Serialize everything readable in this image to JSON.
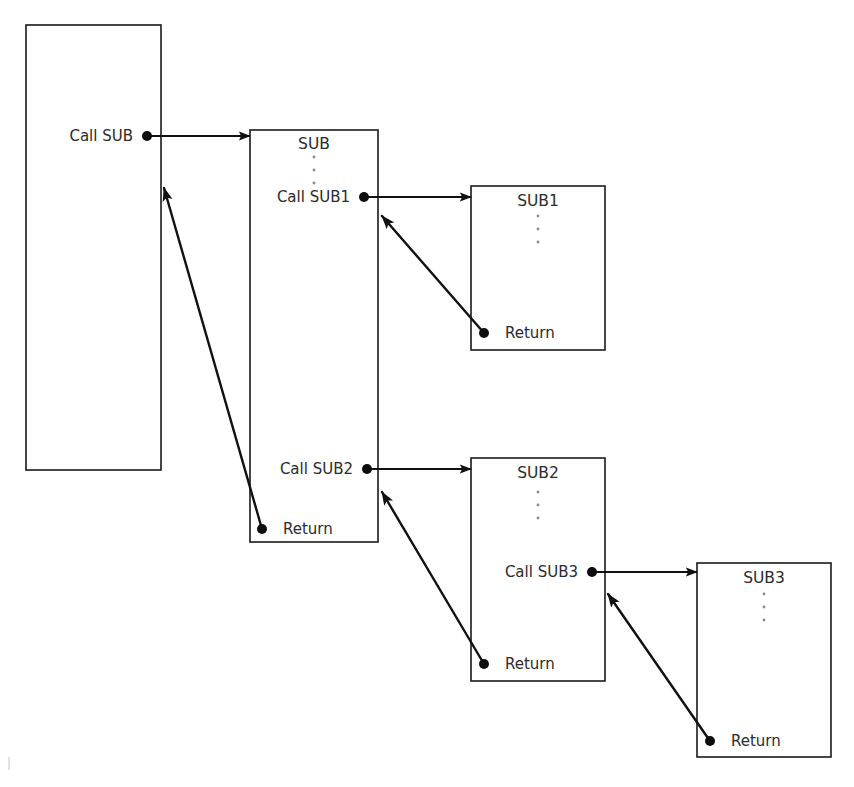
{
  "diagram": {
    "stroke_color": "#111111",
    "box_stroke_color": "#1a1a1a",
    "text_color": "#2b2b2b",
    "background_color": "#ffffff",
    "ellipsis_glyph": "⋮",
    "boxes": [
      {
        "id": "main",
        "name": "main-program-box",
        "label": "",
        "x": 26,
        "y": 25,
        "w": 135,
        "h": 445,
        "title": "",
        "has_title": false,
        "has_ellipsis": false,
        "statements": [
          {
            "text": "Call SUB",
            "x": 133,
            "y": 136,
            "align": "end",
            "dot_x": 147,
            "dot_y": 136,
            "has_dot": true
          }
        ]
      },
      {
        "id": "sub",
        "name": "sub-box",
        "title": "SUB",
        "x": 250,
        "y": 130,
        "w": 128,
        "h": 412,
        "title_x": 314,
        "title_y": 144,
        "has_title": true,
        "has_ellipsis": true,
        "ellipsis_x": 314,
        "ellipsis_y0": 157,
        "ellipsis_count": 3,
        "ellipsis_gap": 13,
        "statements": [
          {
            "text": "Call SUB1",
            "x": 350,
            "y": 197,
            "align": "end",
            "dot_x": 364,
            "dot_y": 197,
            "has_dot": true
          },
          {
            "text": "Call SUB2",
            "x": 353,
            "y": 469,
            "align": "end",
            "dot_x": 367,
            "dot_y": 469,
            "has_dot": true
          },
          {
            "text": "Return",
            "x": 283,
            "y": 529,
            "align": "start",
            "dot_x": 262,
            "dot_y": 529,
            "has_dot": true
          }
        ]
      },
      {
        "id": "sub1",
        "name": "sub1-box",
        "title": "SUB1",
        "x": 471,
        "y": 186,
        "w": 134,
        "h": 164,
        "title_x": 538,
        "title_y": 201,
        "has_title": true,
        "has_ellipsis": true,
        "ellipsis_x": 538,
        "ellipsis_y0": 216,
        "ellipsis_count": 3,
        "ellipsis_gap": 13,
        "statements": [
          {
            "text": "Return",
            "x": 505,
            "y": 333,
            "align": "start",
            "dot_x": 484,
            "dot_y": 333,
            "has_dot": true
          }
        ]
      },
      {
        "id": "sub2",
        "name": "sub2-box",
        "title": "SUB2",
        "x": 471,
        "y": 458,
        "w": 134,
        "h": 223,
        "title_x": 538,
        "title_y": 473,
        "has_title": true,
        "has_ellipsis": true,
        "ellipsis_x": 538,
        "ellipsis_y0": 492,
        "ellipsis_count": 3,
        "ellipsis_gap": 13,
        "statements": [
          {
            "text": "Call SUB3",
            "x": 578,
            "y": 572,
            "align": "end",
            "dot_x": 592,
            "dot_y": 572,
            "has_dot": true
          },
          {
            "text": "Return",
            "x": 505,
            "y": 664,
            "align": "start",
            "dot_x": 484,
            "dot_y": 664,
            "has_dot": true
          }
        ]
      },
      {
        "id": "sub3",
        "name": "sub3-box",
        "title": "SUB3",
        "x": 697,
        "y": 563,
        "w": 134,
        "h": 194,
        "title_x": 764,
        "title_y": 578,
        "has_title": true,
        "has_ellipsis": true,
        "ellipsis_x": 764,
        "ellipsis_y0": 594,
        "ellipsis_count": 3,
        "ellipsis_gap": 13,
        "statements": [
          {
            "text": "Return",
            "x": 731,
            "y": 741,
            "align": "start",
            "dot_x": 710,
            "dot_y": 741,
            "has_dot": true
          }
        ]
      }
    ],
    "call_arrows": [
      {
        "id": "call-sub",
        "name": "call-arrow-main-to-sub",
        "from_label": "Call SUB",
        "to_box": "SUB",
        "x1": 147,
        "y1": 136,
        "x2": 250,
        "y2": 136
      },
      {
        "id": "call-sub1",
        "name": "call-arrow-sub-to-sub1",
        "from_label": "Call SUB1",
        "to_box": "SUB1",
        "x1": 364,
        "y1": 197,
        "x2": 471,
        "y2": 197
      },
      {
        "id": "call-sub2",
        "name": "call-arrow-sub-to-sub2",
        "from_label": "Call SUB2",
        "to_box": "SUB2",
        "x1": 367,
        "y1": 469,
        "x2": 471,
        "y2": 469
      },
      {
        "id": "call-sub3",
        "name": "call-arrow-sub2-to-sub3",
        "from_label": "Call SUB3",
        "to_box": "SUB3",
        "x1": 592,
        "y1": 572,
        "x2": 697,
        "y2": 572
      }
    ],
    "return_arrows": [
      {
        "id": "ret-sub",
        "name": "return-arrow-sub-to-main",
        "from_label": "Return",
        "to_box": "main",
        "x1": 262,
        "y1": 529,
        "x2": 164,
        "y2": 188
      },
      {
        "id": "ret-sub1",
        "name": "return-arrow-sub1-to-sub",
        "from_label": "Return",
        "to_box": "SUB",
        "x1": 484,
        "y1": 333,
        "x2": 382,
        "y2": 216
      },
      {
        "id": "ret-sub2",
        "name": "return-arrow-sub2-to-sub",
        "from_label": "Return",
        "to_box": "SUB",
        "x1": 484,
        "y1": 664,
        "x2": 382,
        "y2": 492
      },
      {
        "id": "ret-sub3",
        "name": "return-arrow-sub3-to-sub2",
        "from_label": "Return",
        "to_box": "SUB2",
        "x1": 710,
        "y1": 741,
        "x2": 608,
        "y2": 594
      }
    ]
  }
}
